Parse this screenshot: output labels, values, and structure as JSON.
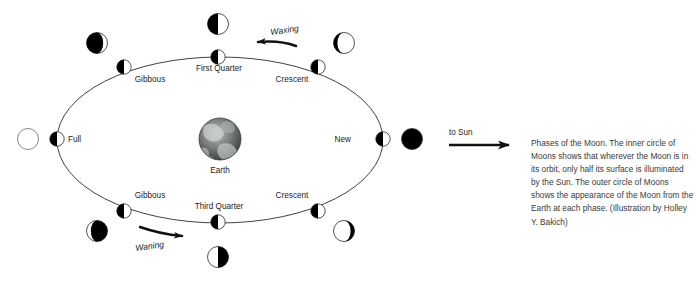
{
  "figure": {
    "type": "astronomy-diagram",
    "subject": "Phases of the Moon",
    "center_body_label": "Earth",
    "sun_direction_label": "to Sun",
    "direction_labels": {
      "waxing": "Waxing",
      "waning": "Waning"
    },
    "caption": "Phases of the Moon. The inner circle of Moons shows that wherever the Moon is in its orbit, only half its surface is illuminated by the Sun. The outer circle of Moons shows the appearance of the Moon from the Earth at each phase. (Illustration by Holley Y. Bakich)",
    "colors": {
      "illuminated": "#ffffff",
      "shadow": "#000000",
      "stroke": "#2b2b2b",
      "text": "#1d1d1d",
      "caption_text": "#3a3a3a",
      "background": "#ffffff"
    },
    "orbit": {
      "center_x": 220,
      "center_y": 140,
      "radius_x": 163,
      "radius_y": 83
    },
    "phases": [
      {
        "id": "new",
        "label": "New",
        "label_x": 351,
        "label_y": 139,
        "label_anchor": "end",
        "inner_x": 383,
        "inner_y": 139,
        "outer_x": 412,
        "outer_y": 139,
        "outer_appearance": "full-dark"
      },
      {
        "id": "waxing-crescent",
        "label": "Crescent",
        "label_x": 292,
        "label_y": 79,
        "label_anchor": "middle",
        "inner_x": 318,
        "inner_y": 67,
        "outer_x": 344,
        "outer_y": 43,
        "outer_appearance": "crescent-right"
      },
      {
        "id": "first-quarter",
        "label": "First Quarter",
        "label_x": 219,
        "label_y": 68,
        "label_anchor": "middle",
        "inner_x": 218,
        "inner_y": 57,
        "outer_x": 218,
        "outer_y": 24,
        "outer_appearance": "half-light-right"
      },
      {
        "id": "waxing-gibbous",
        "label": "Gibbous",
        "label_x": 150,
        "label_y": 79,
        "label_anchor": "middle",
        "inner_x": 124,
        "inner_y": 67,
        "outer_x": 97,
        "outer_y": 43,
        "outer_appearance": "gibbous-light-right"
      },
      {
        "id": "full",
        "label": "Full",
        "label_x": 69,
        "label_y": 139,
        "label_anchor": "start",
        "inner_x": 57,
        "inner_y": 139,
        "outer_x": 28,
        "outer_y": 139,
        "outer_appearance": "full-light"
      },
      {
        "id": "waning-gibbous",
        "label": "Gibbous",
        "label_x": 150,
        "label_y": 195,
        "label_anchor": "middle",
        "inner_x": 124,
        "inner_y": 211,
        "outer_x": 97,
        "outer_y": 231,
        "outer_appearance": "gibbous-light-left"
      },
      {
        "id": "third-quarter",
        "label": "Third Quarter",
        "label_x": 219,
        "label_y": 206,
        "label_anchor": "middle",
        "inner_x": 218,
        "inner_y": 222,
        "outer_x": 218,
        "outer_y": 257,
        "outer_appearance": "half-light-left"
      },
      {
        "id": "waning-crescent",
        "label": "Crescent",
        "label_x": 292,
        "label_y": 195,
        "label_anchor": "middle",
        "inner_x": 318,
        "inner_y": 211,
        "outer_x": 344,
        "outer_y": 231,
        "outer_appearance": "crescent-left"
      }
    ]
  }
}
